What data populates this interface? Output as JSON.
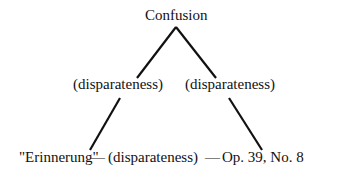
{
  "diagram": {
    "top_node": "Confusion",
    "edge_labels": {
      "left": "(disparateness)",
      "right": "(disparateness)",
      "bottom": "(disparateness)"
    },
    "bottom_left_node": "\"Erinnerung\"",
    "bottom_right_node": "Op. 39, No. 8",
    "bottom_dash_left": "—",
    "bottom_dash_right": "—"
  }
}
